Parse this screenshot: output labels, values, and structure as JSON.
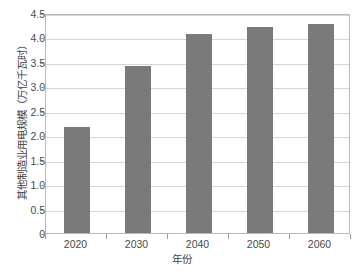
{
  "chart_data": {
    "type": "bar",
    "title": "",
    "xlabel": "年份",
    "ylabel": "其他制造业用电规模（万亿千瓦时）",
    "categories": [
      "2020",
      "2030",
      "2040",
      "2050",
      "2060"
    ],
    "values": [
      2.17,
      3.41,
      4.07,
      4.22,
      4.27
    ],
    "series": [
      {
        "name": "其他制造业用电规模",
        "values": [
          2.17,
          3.41,
          4.07,
          4.22,
          4.27
        ]
      }
    ],
    "ylim": [
      0,
      4.5
    ],
    "ytick_labels": [
      "0",
      "0.5",
      "1.0",
      "1.5",
      "2.0",
      "2.5",
      "3.0",
      "3.5",
      "4.0",
      "4.5"
    ],
    "ytick_values": [
      0,
      0.5,
      1.0,
      1.5,
      2.0,
      2.5,
      3.0,
      3.5,
      4.0,
      4.5
    ],
    "xtick_labels": [
      "2020",
      "2030",
      "2040",
      "2050",
      "2060"
    ],
    "grid": "horizontal",
    "legend": "none",
    "bar_color": "#7a7a7a",
    "gridline_color": "#d6d6d6",
    "frame_color": "#b9b9b9",
    "background_color": "#ffffff"
  }
}
